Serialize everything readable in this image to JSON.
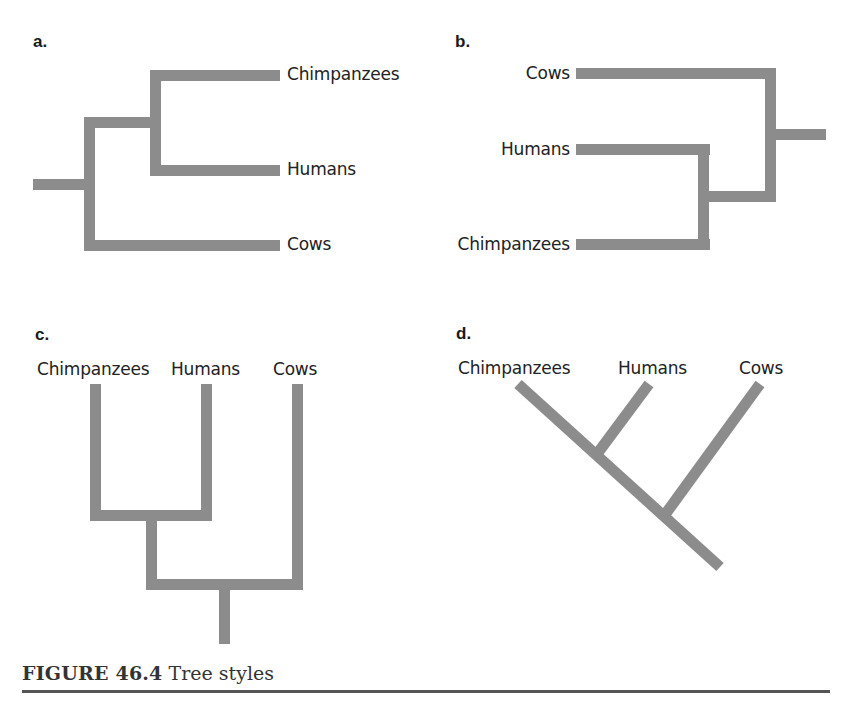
{
  "figure": {
    "number_label": "FIGURE 46.4",
    "title": "Tree styles",
    "branch_color": "#8c8c8c",
    "rule_color": "#555555"
  },
  "panels": {
    "a": {
      "label": "a.",
      "style": "horizontal rectangular, root left",
      "taxa": [
        "Chimpanzees",
        "Humans",
        "Cows"
      ]
    },
    "b": {
      "label": "b.",
      "style": "horizontal rectangular, root right",
      "taxa": [
        "Cows",
        "Humans",
        "Chimpanzees"
      ]
    },
    "c": {
      "label": "c.",
      "style": "vertical rectangular, root bottom",
      "taxa": [
        "Chimpanzees",
        "Humans",
        "Cows"
      ]
    },
    "d": {
      "label": "d.",
      "style": "diagonal (slanted), root bottom right",
      "taxa": [
        "Chimpanzees",
        "Humans",
        "Cows"
      ]
    }
  },
  "topology": "((Chimpanzees, Humans), Cows)"
}
